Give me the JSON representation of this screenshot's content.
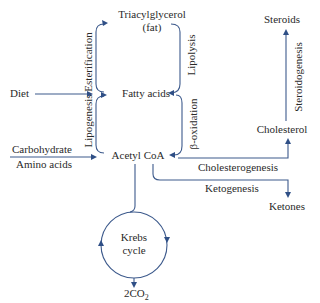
{
  "diagram": {
    "nodes": {
      "triacylglycerol": "Triacylglycerol",
      "fat": "(fat)",
      "fatty_acids": "Fatty acids",
      "acetyl_coa": "Acetyl CoA",
      "diet": "Diet",
      "carbohydrate": "Carbohydrate",
      "amino_acids": "Amino acids",
      "steroids": "Steroids",
      "cholesterol": "Cholesterol",
      "ketones": "Ketones",
      "krebs_line1": "Krebs",
      "krebs_line2": "cycle",
      "co2_main": "2CO",
      "co2_sub": "2"
    },
    "processes": {
      "esterification": "Esterification",
      "lipolysis": "Lipolysis",
      "lipogenesis": "Lipogenesis",
      "beta_oxidation": "β-oxidation",
      "steroidogenesis": "Steroidogenesis",
      "cholesterogenesis": "Cholesterogenesis",
      "ketogenesis": "Ketogenesis"
    },
    "colors": {
      "arrow": "#3d5a8c",
      "text": "#2a2a2a"
    }
  }
}
